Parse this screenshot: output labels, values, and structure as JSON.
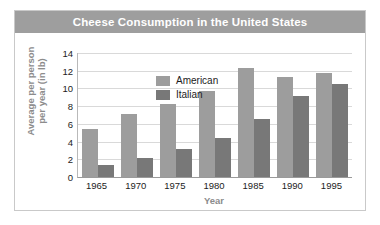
{
  "figure": {
    "title": "Cheese Consumption in the United States",
    "title_band_color": "#9e9e9e",
    "panel_background": "#ffffff",
    "border_color": "#c9c9c9"
  },
  "legend": {
    "position": "top-left-inside",
    "entries": [
      {
        "label": "American",
        "color": "#9d9d9d"
      },
      {
        "label": "Italian",
        "color": "#787878"
      }
    ]
  },
  "axes": {
    "y_title_line1": "Average per person",
    "y_title_line2": "per year (in lb)",
    "x_title": "Year",
    "y_ticks": [
      "0",
      "2",
      "4",
      "6",
      "8",
      "10",
      "12",
      "14"
    ],
    "x_ticks": [
      "1965",
      "1970",
      "1975",
      "1980",
      "1985",
      "1990",
      "1995"
    ]
  },
  "chart_data": {
    "type": "bar",
    "title": "Cheese Consumption in the United States",
    "xlabel": "Year",
    "ylabel": "Average per person per year (in lb)",
    "categories": [
      "1965",
      "1970",
      "1975",
      "1980",
      "1985",
      "1990",
      "1995"
    ],
    "series": [
      {
        "name": "American",
        "color": "#9d9d9d",
        "values": [
          5.4,
          7.1,
          8.2,
          9.7,
          12.3,
          11.3,
          11.8
        ]
      },
      {
        "name": "Italian",
        "color": "#787878",
        "values": [
          1.4,
          2.1,
          3.2,
          4.4,
          6.5,
          9.1,
          10.5
        ]
      }
    ],
    "ylim": [
      0,
      14
    ],
    "ytick_step": 2,
    "grid": true,
    "legend_position": "upper left"
  }
}
